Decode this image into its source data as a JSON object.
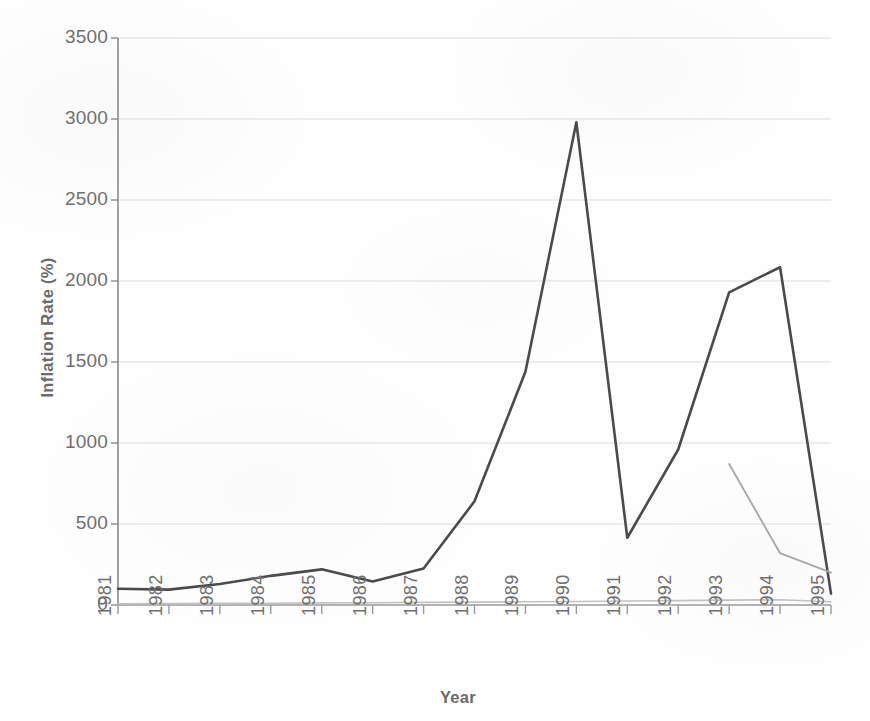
{
  "chart_data": {
    "type": "line",
    "title": "",
    "xlabel": "Year",
    "ylabel": "Inflation Rate (%)",
    "x": [
      1981,
      1982,
      1983,
      1984,
      1985,
      1986,
      1987,
      1988,
      1989,
      1990,
      1991,
      1992,
      1993,
      1994,
      1995
    ],
    "categories": [
      "1981",
      "1982",
      "1983",
      "1984",
      "1985",
      "1986",
      "1987",
      "1988",
      "1989",
      "1990",
      "1991",
      "1992",
      "1993",
      "1994",
      "1995"
    ],
    "xlim": [
      1981,
      1995
    ],
    "ylim": [
      0,
      3500
    ],
    "yticks": [
      0,
      500,
      1000,
      1500,
      2000,
      2500,
      3000,
      3500
    ],
    "ytick_labels": [
      "0",
      "500",
      "1000",
      "1500",
      "2000",
      "2500",
      "3000",
      "3500"
    ],
    "xticks": [
      1981,
      1982,
      1983,
      1984,
      1985,
      1986,
      1987,
      1988,
      1989,
      1990,
      1991,
      1992,
      1993,
      1994,
      1995
    ],
    "grid": true,
    "grid_axis": "y",
    "legend": false,
    "legend_position": "none",
    "series": [
      {
        "name": "series-1",
        "color": "#4a4a4a",
        "x": [
          1981,
          1982,
          1983,
          1984,
          1985,
          1986,
          1987,
          1988,
          1989,
          1990,
          1991,
          1992,
          1993,
          1994,
          1995
        ],
        "values": [
          100,
          95,
          130,
          180,
          220,
          145,
          225,
          640,
          1440,
          2980,
          415,
          960,
          1930,
          2085,
          70
        ]
      },
      {
        "name": "series-2",
        "color": "#a8a8a8",
        "x": [
          1993,
          1994,
          1995
        ],
        "values": [
          870,
          320,
          200
        ]
      },
      {
        "name": "series-3",
        "color": "#c2c2c2",
        "x": [
          1981,
          1982,
          1983,
          1984,
          1985,
          1986,
          1987,
          1988,
          1989,
          1990,
          1991,
          1992,
          1993,
          1994,
          1995
        ],
        "values": [
          8,
          9,
          10,
          11,
          13,
          14,
          16,
          18,
          20,
          22,
          25,
          27,
          30,
          32,
          20
        ]
      }
    ]
  }
}
